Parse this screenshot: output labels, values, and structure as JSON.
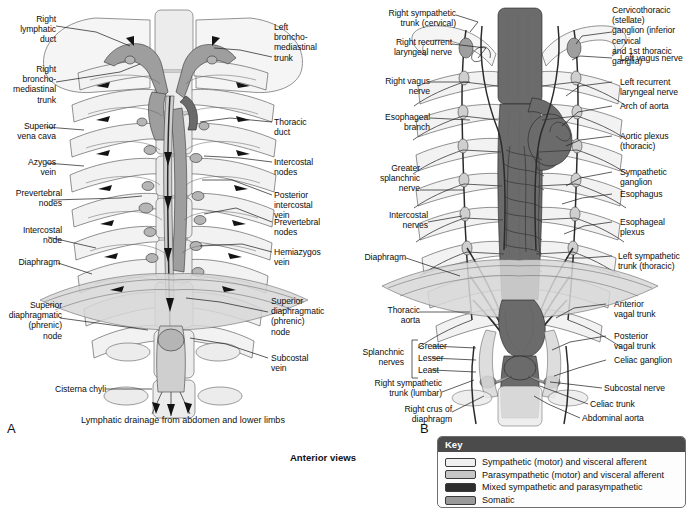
{
  "figure": {
    "caption": "Anterior views",
    "sub_caption": "Lymphatic drainage from abdomen and lower limbs",
    "panel_a_letter": "A",
    "panel_b_letter": "B"
  },
  "panel_a": {
    "title_letter": "A",
    "labels_left": [
      {
        "id": "right-lymphatic-duct",
        "text": "Right\nlymphatic\nduct"
      },
      {
        "id": "right-bronchomediastinal-trunk",
        "text": "Right\nbroncho-\nmediastinal\ntrunk"
      },
      {
        "id": "superior-vena-cava",
        "text": "Superior\nvena cava"
      },
      {
        "id": "azygos-vein",
        "text": "Azygos\nvein"
      },
      {
        "id": "prevertebral-nodes",
        "text": "Prevertebral\nnodes"
      },
      {
        "id": "intercostal-node",
        "text": "Intercostal\nnode"
      },
      {
        "id": "diaphragm",
        "text": "Diaphragm"
      },
      {
        "id": "superior-diaphragmatic-phrenic-node-left",
        "text": "Superior\ndiaphragmatic\n(phrenic)\nnode"
      },
      {
        "id": "cisterna-chyli",
        "text": "Cisterna chyli"
      }
    ],
    "labels_right": [
      {
        "id": "left-bronchomediastinal-trunk",
        "text": "Left\nbroncho-\nmediastinal\ntrunk"
      },
      {
        "id": "thoracic-duct",
        "text": "Thoracic\nduct"
      },
      {
        "id": "intercostal-nodes",
        "text": "Intercostal\nnodes"
      },
      {
        "id": "posterior-intercostal-vein",
        "text": "Posterior\nintercostal\nvein"
      },
      {
        "id": "prevertebral-nodes-right",
        "text": "Prevertebral\nnodes"
      },
      {
        "id": "hemiazygos-vein",
        "text": "Hemiazygos\nvein"
      },
      {
        "id": "superior-diaphragmatic-phrenic-node-right",
        "text": "Superior\ndiaphragmatic\n(phrenic)\nnode"
      },
      {
        "id": "subcostal-vein",
        "text": "Subcostal\nvein"
      }
    ]
  },
  "panel_b": {
    "title_letter": "B",
    "labels_left": [
      {
        "id": "right-sympathetic-trunk-cervical",
        "text": "Right sympathetic\ntrunk (cervical)"
      },
      {
        "id": "right-recurrent-laryngeal-nerve",
        "text": "Right recurrent\nlaryngeal nerve"
      },
      {
        "id": "right-vagus-nerve",
        "text": "Right vagus\nnerve"
      },
      {
        "id": "esophageal-branch",
        "text": "Esophageal\nbranch"
      },
      {
        "id": "greater-splanchnic-nerve",
        "text": "Greater\nsplanchnic\nnerve"
      },
      {
        "id": "intercostal-nerves",
        "text": "Intercostal\nnerves"
      },
      {
        "id": "diaphragm-b",
        "text": "Diaphragm"
      },
      {
        "id": "thoracic-aorta",
        "text": "Thoracic\naorta"
      },
      {
        "id": "splanchnic-nerves",
        "text": "Splanchnic\nnerves"
      },
      {
        "id": "right-sympathetic-trunk-lumbar",
        "text": "Right sympathetic\ntrunk (lumbar)"
      },
      {
        "id": "right-crus-of-diaphragm",
        "text": "Right crus of\ndiaphragm"
      }
    ],
    "splanchnic_bracket": [
      {
        "id": "greater",
        "text": "Greater"
      },
      {
        "id": "lesser",
        "text": "Lesser"
      },
      {
        "id": "least",
        "text": "Least"
      }
    ],
    "labels_right": [
      {
        "id": "cervicothoracic-stellate-ganglion",
        "text": "Cervicothoracic (stellate)\nganglion (inferior cervical\nand 1st thoracic ganglia)"
      },
      {
        "id": "left-vagus-nerve",
        "text": "Left vagus nerve"
      },
      {
        "id": "left-recurrent-laryngeal-nerve",
        "text": "Left recurrent\nlaryngeal nerve"
      },
      {
        "id": "arch-of-aorta",
        "text": "Arch of aorta"
      },
      {
        "id": "aortic-plexus-thoracic",
        "text": "Aortic plexus\n(thoracic)"
      },
      {
        "id": "sympathetic-ganglion",
        "text": "Sympathetic\nganglion"
      },
      {
        "id": "esophagus",
        "text": "Esophagus"
      },
      {
        "id": "esophageal-plexus",
        "text": "Esophageal\nplexus"
      },
      {
        "id": "left-sympathetic-trunk-thoracic",
        "text": "Left sympathetic\ntrunk (thoracic)"
      },
      {
        "id": "anterior-vagal-trunk",
        "text": "Anterior\nvagal trunk"
      },
      {
        "id": "posterior-vagal-trunk",
        "text": "Posterior\nvagal trunk"
      },
      {
        "id": "celiac-ganglion",
        "text": "Celiac ganglion"
      },
      {
        "id": "subcostal-nerve",
        "text": "Subcostal nerve"
      },
      {
        "id": "celiac-trunk",
        "text": "Celiac trunk"
      },
      {
        "id": "abdominal-aorta",
        "text": "Abdominal aorta"
      }
    ]
  },
  "key": {
    "title": "Key",
    "items": [
      {
        "label": "Sympathetic (motor) and visceral afferent",
        "color": "#f0f0f0"
      },
      {
        "label": "Parasympathetic (motor) and visceral afferent",
        "color": "#c6c6c6"
      },
      {
        "label": "Mixed sympathetic and parasympathetic",
        "color": "#2e2e2e"
      },
      {
        "label": "Somatic",
        "color": "#9a9a9a"
      }
    ]
  }
}
